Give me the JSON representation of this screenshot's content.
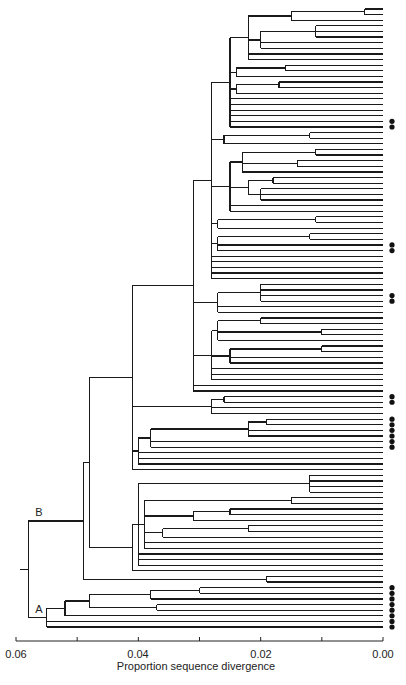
{
  "figure": {
    "type": "phylogenetic-tree",
    "axis": {
      "title": "Proportion sequence divergence",
      "ticks": [
        "0.06",
        "0.04",
        "0.02",
        "0.00"
      ],
      "tick_values": [
        0.06,
        0.05,
        0.04,
        0.03,
        0.02,
        0.01,
        0.0
      ],
      "range": [
        0.06,
        0.0
      ]
    },
    "clade_labels": {
      "A": "A",
      "B": "B"
    },
    "dot_groups": [
      {
        "position": "clade-B-upper",
        "count": 2
      },
      {
        "position": "clade-B-middle-1",
        "count": 2
      },
      {
        "position": "clade-B-middle-2",
        "count": 2
      },
      {
        "position": "clade-B-lower-1",
        "count": 2
      },
      {
        "position": "clade-B-lower-2",
        "count": 6
      },
      {
        "position": "clade-A",
        "count": 8
      }
    ],
    "colors": {
      "line": "#1a1a1a",
      "dot": "#111111",
      "background": "#ffffff"
    }
  },
  "tree": {
    "h": 0.058,
    "c": [
      {
        "label": "B",
        "h": 0.049,
        "c": [
          {
            "h": 0.048,
            "c": [
              {
                "h": 0.042,
                "c": [
                  {
                    "h": 0.041,
                    "c": [
                      {
                        "h": 0.031,
                        "c": [
                          {
                            "h": 0.028,
                            "c": [
                              {
                                "h": 0.025,
                                "c": [
                                  {
                                    "h": 0.022,
                                    "c": [
                                      {
                                        "h": 0.015,
                                        "c": [
                                          {
                                            "h": 0.003,
                                            "c": [
                                              {},
                                              {}
                                            ]
                                          },
                                          {}
                                        ]
                                      },
                                      {
                                        "h": 0.02,
                                        "c": [
                                          {
                                            "h": 0.011,
                                            "c": [
                                              {},
                                              {},
                                              {}
                                            ]
                                          },
                                          {},
                                          {}
                                        ]
                                      },
                                      {},
                                      {}
                                    ]
                                  },
                                  {
                                    "h": 0.024,
                                    "c": [
                                      {
                                        "h": 0.016,
                                        "c": [
                                          {},
                                          {}
                                        ]
                                      },
                                      {}
                                    ]
                                  },
                                  {
                                    "h": 0.024,
                                    "c": [
                                      {
                                        "h": 0.017,
                                        "c": [
                                          {},
                                          {}
                                        ]
                                      },
                                      {}
                                    ]
                                  },
                                  {},
                                  {},
                                  {},
                                  {},
                                  {
                                    "dot": true
                                  },
                                  {
                                    "dot": true
                                  }
                                ]
                              },
                              {
                                "h": 0.026,
                                "c": [
                                  {
                                    "h": 0.012,
                                    "c": [
                                      {},
                                      {}
                                    ]
                                  },
                                  {}
                                ]
                              },
                              {
                                "h": 0.025,
                                "c": [
                                  {
                                    "h": 0.023,
                                    "c": [
                                      {
                                        "h": 0.011,
                                        "c": [
                                          {},
                                          {}
                                        ]
                                      },
                                      {
                                        "h": 0.014,
                                        "c": [
                                          {},
                                          {}
                                        ]
                                      },
                                      {}
                                    ]
                                  },
                                  {
                                    "h": 0.022,
                                    "c": [
                                      {
                                        "h": 0.018,
                                        "c": [
                                          {},
                                          {}
                                        ]
                                      },
                                      {
                                        "h": 0.02,
                                        "c": [
                                          {},
                                          {},
                                          {}
                                        ]
                                      }
                                    ]
                                  },
                                  {},
                                  {}
                                ]
                              },
                              {
                                "h": 0.027,
                                "c": [
                                  {
                                    "h": 0.011,
                                    "c": [
                                      {},
                                      {}
                                    ]
                                  },
                                  {}
                                ]
                              },
                              {
                                "h": 0.027,
                                "c": [
                                  {
                                    "h": 0.012,
                                    "c": [
                                      {},
                                      {}
                                    ]
                                  },
                                  {
                                    "dot": true
                                  },
                                  {
                                    "dot": true
                                  }
                                ]
                              },
                              {},
                              {},
                              {},
                              {},
                              {}
                            ]
                          },
                          {
                            "h": 0.027,
                            "c": [
                              {
                                "h": 0.02,
                                "c": [
                                  {},
                                  {},
                                  {
                                    "dot": true
                                  },
                                  {
                                    "dot": true
                                  }
                                ]
                              },
                              {},
                              {}
                            ]
                          },
                          {
                            "h": 0.028,
                            "c": [
                              {
                                "h": 0.027,
                                "c": [
                                  {
                                    "h": 0.02,
                                    "c": [
                                      {},
                                      {}
                                    ]
                                  },
                                  {
                                    "h": 0.01,
                                    "c": [
                                      {},
                                      {}
                                    ]
                                  },
                                  {}
                                ]
                              },
                              {
                                "h": 0.025,
                                "c": [
                                  {
                                    "h": 0.01,
                                    "c": [
                                      {},
                                      {}
                                    ]
                                  },
                                  {},
                                  {}
                                ]
                              },
                              {},
                              {},
                              {}
                            ]
                          },
                          {},
                          {}
                        ]
                      },
                      {
                        "h": 0.028,
                        "c": [
                          {
                            "h": 0.026,
                            "c": [
                              {
                                "dot": true
                              },
                              {
                                "dot": true
                              }
                            ]
                          },
                          {},
                          {}
                        ]
                      },
                      {
                        "h": 0.04,
                        "c": [
                          {
                            "h": 0.038,
                            "c": [
                              {
                                "h": 0.022,
                                "c": [
                                  {
                                    "h": 0.019,
                                    "c": [
                                      {
                                        "dot": true
                                      },
                                      {
                                        "dot": true
                                      }
                                    ]
                                  },
                                  {
                                    "dot": true
                                  },
                                  {
                                    "dot": true
                                  }
                                ]
                              },
                              {
                                "dot": true
                              },
                              {
                                "dot": true
                              }
                            ]
                          },
                          {},
                          {},
                          {}
                        ]
                      },
                      {}
                    ]
                  }
                ]
              },
              {
                "h": 0.041,
                "c": [
                  {
                    "h": 0.04,
                    "c": [
                      {
                        "h": 0.012,
                        "c": [
                          {},
                          {},
                          {},
                          {}
                        ]
                      },
                      {
                        "h": 0.039,
                        "c": [
                          {
                            "h": 0.015,
                            "c": [
                              {},
                              {}
                            ]
                          },
                          {
                            "h": 0.031,
                            "c": [
                              {
                                "h": 0.025,
                                "c": [
                                  {},
                                  {}
                                ]
                              },
                              {}
                            ]
                          },
                          {
                            "h": 0.036,
                            "c": [
                              {
                                "h": 0.022,
                                "c": [
                                  {},
                                  {}
                                ]
                              },
                              {}
                            ]
                          },
                          {},
                          {}
                        ]
                      },
                      {},
                      {},
                      {}
                    ]
                  },
                  {}
                ]
              }
            ]
          },
          {
            "h": 0.019,
            "c": [
              {},
              {}
            ]
          }
        ]
      },
      {
        "label": "A",
        "h": 0.055,
        "c": [
          {
            "h": 0.052,
            "c": [
              {
                "h": 0.048,
                "c": [
                  {
                    "h": 0.038,
                    "c": [
                      {
                        "h": 0.03,
                        "c": [
                          {
                            "dot": true
                          },
                          {
                            "dot": true
                          }
                        ]
                      },
                      {
                        "dot": true
                      }
                    ]
                  },
                  {
                    "h": 0.037,
                    "c": [
                      {
                        "dot": true
                      },
                      {
                        "dot": true
                      }
                    ]
                  }
                ]
              },
              {
                "dot": true
              }
            ]
          },
          {
            "dot": true
          },
          {
            "dot": true
          }
        ]
      }
    ]
  }
}
